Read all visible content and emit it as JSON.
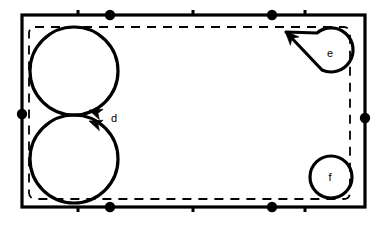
{
  "figure": {
    "type": "knot-diagram",
    "background_color": "#ffffff",
    "stroke_color": "#000000",
    "solid_rectangle": {
      "name": "outer-boundary",
      "x": 22,
      "y": 15,
      "width": 343,
      "height": 192,
      "stroke_width": 3.2,
      "dashed": false
    },
    "dashed_rectangle": {
      "name": "inner-boundary",
      "x": 29,
      "y": 27,
      "width": 321,
      "height": 172,
      "stroke_width": 1.8,
      "dash_pattern": "9 7",
      "corner_radius": 5
    },
    "markers": {
      "dot_radius": 5.2,
      "tick_length": 5,
      "tick_width": 3,
      "top_dots": [
        110,
        272
      ],
      "top_ticks": [
        78,
        193,
        305
      ],
      "bottom_dots": [
        110,
        272
      ],
      "bottom_ticks": [
        78,
        193,
        305
      ],
      "left_dots": [
        114
      ],
      "right_dots": [
        118
      ]
    },
    "circles": [
      {
        "name": "circle-d-upper",
        "cx": 74,
        "cy": 71,
        "r": 44,
        "stroke_width": 3.2
      },
      {
        "name": "circle-d-lower",
        "cx": 74,
        "cy": 159,
        "r": 44,
        "stroke_width": 3.2
      },
      {
        "name": "circle-f",
        "cx": 331,
        "cy": 177,
        "r": 21,
        "stroke_width": 3.2
      }
    ],
    "teardrop": {
      "name": "loop-e",
      "cx": 331,
      "cy": 53,
      "r": 22,
      "tail_tip_x": 286,
      "tail_tip_y": 32,
      "stroke_width": 3.2
    },
    "arrowheads": [
      {
        "name": "arrowhead-d-upper",
        "x": 88,
        "y": 110,
        "angle": 200
      },
      {
        "name": "arrowhead-d-lower",
        "x": 88,
        "y": 120,
        "angle": 200
      },
      {
        "name": "arrowhead-e",
        "x": 286,
        "y": 32,
        "angle": 208
      }
    ],
    "labels": [
      {
        "name": "label-d",
        "text": "d",
        "x": 114,
        "y": 122
      },
      {
        "name": "label-e",
        "text": "e",
        "x": 330,
        "y": 57
      },
      {
        "name": "label-f",
        "text": "f",
        "x": 330,
        "y": 181
      }
    ]
  }
}
